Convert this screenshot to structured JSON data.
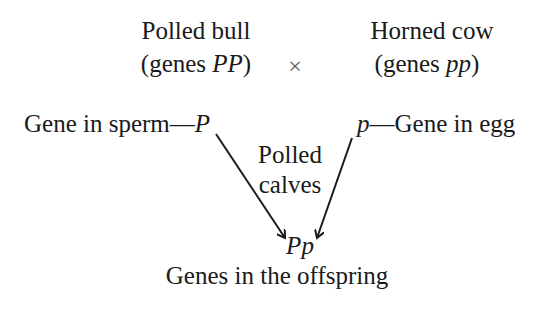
{
  "parent1": {
    "name": "Polled bull",
    "genes_prefix": "(genes ",
    "genes": "PP",
    "genes_suffix": ")"
  },
  "cross_symbol": "×",
  "parent2": {
    "name": "Horned cow",
    "genes_prefix": "(genes ",
    "genes": "pp",
    "genes_suffix": ")"
  },
  "gamete1": {
    "label": "Gene in sperm—",
    "gene": "P"
  },
  "gamete2": {
    "gene": "p",
    "label": "—Gene in egg"
  },
  "phenotype": {
    "line1": "Polled",
    "line2": "calves"
  },
  "offspring": {
    "genes": "Pp",
    "label": "Genes in the offspring"
  },
  "colors": {
    "ink": "#1a1a1a",
    "background": "#ffffff"
  }
}
